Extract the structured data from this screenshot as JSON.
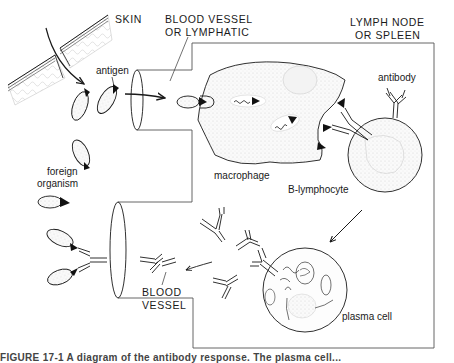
{
  "diagram": {
    "labels": {
      "skin": "SKIN",
      "blood_vessel_or_lymphatic_line1": "BLOOD VESSEL",
      "blood_vessel_or_lymphatic_line2": "OR LYMPHATIC",
      "lymph_node_line1": "LYMPH NODE",
      "lymph_node_line2": "OR SPLEEN",
      "antigen": "antigen",
      "antibody": "antibody",
      "foreign_organism_line1": "foreign",
      "foreign_organism_line2": "organism",
      "macrophage": "macrophage",
      "b_lymphocyte": "B-lymphocyte",
      "plasma_cell": "plasma cell",
      "blood_vessel_line1": "BLOOD",
      "blood_vessel_line2": "VESSEL"
    },
    "caption": "FIGURE 17-1  A diagram of the antibody response. The plasma cell..."
  },
  "colors": {
    "line": "#1a1a1a",
    "frame": "#555555",
    "stipple": "#d8d8d8",
    "background": "#ffffff"
  }
}
